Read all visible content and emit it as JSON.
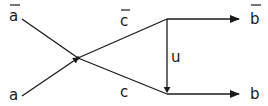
{
  "diagram": {
    "nodes": [
      {
        "id": "a_bar",
        "label": "a",
        "overline": true
      },
      {
        "id": "a",
        "label": "a",
        "overline": false
      },
      {
        "id": "b_bar",
        "label": "b",
        "overline": true
      },
      {
        "id": "b",
        "label": "b",
        "overline": false
      }
    ],
    "edges": [
      {
        "id": "c_bar",
        "label": "c",
        "overline": true,
        "from": "crossing",
        "to": "b_bar"
      },
      {
        "id": "c",
        "label": "c",
        "overline": false,
        "from": "crossing",
        "to": "b"
      },
      {
        "id": "u",
        "label": "u",
        "from": "top-junction",
        "to": "bottom-junction"
      }
    ],
    "labels": {
      "a_bar": "a",
      "a": "a",
      "c_bar": "c",
      "c": "c",
      "u": "u",
      "b_bar": "b",
      "b": "b"
    },
    "colors": {
      "ink": "#1a1a1a",
      "background": "#ffffff"
    }
  }
}
